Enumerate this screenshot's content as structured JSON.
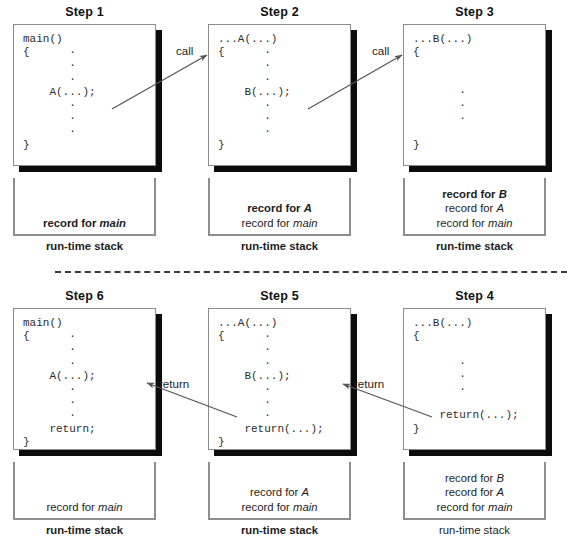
{
  "figure": {
    "divider": "dashed-separator",
    "stack_caption": "run-time stack"
  },
  "steps": [
    {
      "id": "step-1",
      "title": "Step 1",
      "code_lines": [
        "main()",
        "{",
        "·",
        "·",
        "·",
        "A(...);",
        "·",
        "·",
        "·",
        "}"
      ],
      "code_display": "main()\n{",
      "stack_records": [
        {
          "text": "record for ",
          "emphasis": "main",
          "bold": true
        }
      ],
      "stack_caption": "run-time stack",
      "caption_bold": true
    },
    {
      "id": "step-2",
      "title": "Step 2",
      "code_lines": [
        "...A(...)",
        "{",
        "·",
        "·",
        "·",
        "B(...);",
        "·",
        "·",
        "·",
        "}"
      ],
      "stack_records": [
        {
          "text": "record for ",
          "emphasis": "A",
          "bold": true
        },
        {
          "text": "record for ",
          "emphasis": "main",
          "bold": false
        }
      ],
      "stack_caption": "run-time stack",
      "caption_bold": true
    },
    {
      "id": "step-3",
      "title": "Step 3",
      "code_lines": [
        "...B(...)",
        "{",
        "",
        "",
        "·",
        "·",
        "·",
        "",
        "}"
      ],
      "stack_records": [
        {
          "text": "record for ",
          "emphasis": "B",
          "bold": true
        },
        {
          "text": "record for ",
          "emphasis": "A",
          "bold": false
        },
        {
          "text": "record for ",
          "emphasis": "main",
          "bold": false
        }
      ],
      "stack_caption": "run-time stack",
      "caption_bold": true
    },
    {
      "id": "step-4",
      "title": "Step 4",
      "code_lines": [
        "...B(...)",
        "{",
        "",
        "·",
        "·",
        "·",
        "",
        "return(...);",
        "}"
      ],
      "stack_records": [
        {
          "text": "record for ",
          "emphasis": "B",
          "bold": false
        },
        {
          "text": "record for ",
          "emphasis": "A",
          "bold": false
        },
        {
          "text": "record for ",
          "emphasis": "main",
          "bold": false
        }
      ],
      "stack_caption": "run-time stack",
      "caption_bold": false
    },
    {
      "id": "step-5",
      "title": "Step 5",
      "code_lines": [
        "...A(...)",
        "{",
        "·",
        "·",
        "·",
        "B(...);",
        "·",
        "·",
        "·",
        "return(...);",
        "}"
      ],
      "stack_records": [
        {
          "text": "record for ",
          "emphasis": "A",
          "bold": false
        },
        {
          "text": "record for ",
          "emphasis": "main",
          "bold": false
        }
      ],
      "stack_caption": "run-time stack",
      "caption_bold": true
    },
    {
      "id": "step-6",
      "title": "Step 6",
      "code_lines": [
        "main()",
        "{",
        "·",
        "·",
        "·",
        "A(...);",
        "·",
        "·",
        "·",
        "return;",
        "}"
      ],
      "stack_records": [
        {
          "text": "record for ",
          "emphasis": "main",
          "bold": false
        }
      ],
      "stack_caption": "run-time stack",
      "caption_bold": true
    }
  ],
  "arrows": [
    {
      "id": "arrow-call-1",
      "label": "call",
      "from": "step-1",
      "to": "step-2",
      "direction": "up-right"
    },
    {
      "id": "arrow-call-2",
      "label": "call",
      "from": "step-2",
      "to": "step-3",
      "direction": "up-right"
    },
    {
      "id": "arrow-return-1",
      "label": "return",
      "from": "step-4",
      "to": "step-5",
      "direction": "up-left"
    },
    {
      "id": "arrow-return-2",
      "label": "return",
      "from": "step-5",
      "to": "step-6",
      "direction": "up-left"
    }
  ],
  "code": {
    "s1": "main()\n{      ·\n       ·\n       ·\n    A(...);\n       ·\n       ·\n       ·\n}",
    "s2": "...A(...)\n{      ·\n       ·\n       ·\n    B(...);\n       ·\n       ·\n       ·\n}",
    "s3": "...B(...)\n{\n\n\n       ·\n       ·\n       ·\n\n}",
    "s4": "...B(...)\n{\n\n       ·\n       ·\n       ·\n\n    return(...);\n}",
    "s5": "...A(...)\n{      ·\n       ·\n       ·\n    B(...);\n       ·\n       ·\n       ·\n    return(...);\n}",
    "s6": "main()\n{      ·\n       ·\n       ·\n    A(...);\n       ·\n       ·\n       ·\n    return;\n}"
  },
  "colors": {
    "shadow": "#0c0c0c",
    "box_border": "#8c8c8c",
    "stack_border": "#8e8e8e",
    "arrow": "#555555",
    "divider": "#3a3a3a",
    "text": "#1d1d1d"
  }
}
